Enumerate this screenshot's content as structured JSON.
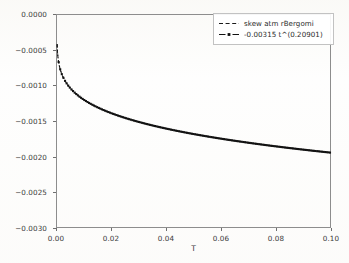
{
  "chart_data": {
    "type": "line",
    "title": "",
    "xlabel": "T",
    "ylabel": "",
    "xlim": [
      0.0,
      0.1
    ],
    "ylim": [
      -0.003,
      0.0
    ],
    "grid": false,
    "legend_position": "upper right",
    "xticks": [
      0.0,
      0.02,
      0.04,
      0.06,
      0.08,
      0.1
    ],
    "xtick_labels": [
      "0.00",
      "0.02",
      "0.04",
      "0.06",
      "0.08",
      "0.10"
    ],
    "yticks": [
      0.0,
      -0.0005,
      -0.001,
      -0.0015,
      -0.002,
      -0.0025,
      -0.003
    ],
    "ytick_labels": [
      "0.0000",
      "−0.0005",
      "−0.0010",
      "−0.0015",
      "−0.0020",
      "−0.0025",
      "−0.0030"
    ],
    "fit": {
      "coefficient": -0.00315,
      "exponent": 0.20901
    },
    "series": [
      {
        "name": "skew atm rBergomi",
        "style": "dashed",
        "marker": "none",
        "color": "#1a1a1a",
        "x": [
          0.0005,
          0.001,
          0.0015,
          0.002,
          0.0025,
          0.003,
          0.004,
          0.005,
          0.006,
          0.008,
          0.01,
          0.012,
          0.014,
          0.016,
          0.018,
          0.02,
          0.024,
          0.028,
          0.032,
          0.036,
          0.04,
          0.045,
          0.05,
          0.055,
          0.06,
          0.065,
          0.07,
          0.075,
          0.08,
          0.085,
          0.09,
          0.095,
          0.1
        ],
        "y": [
          -0.000683,
          -0.000789,
          -0.00086,
          -0.000912,
          -0.000955,
          -0.000992,
          -0.001052,
          -0.001099,
          -0.001139,
          -0.001204,
          -0.001256,
          -0.0013,
          -0.001338,
          -0.001372,
          -0.001402,
          -0.00143,
          -0.001479,
          -0.001522,
          -0.00156,
          -0.001594,
          -0.001625,
          -0.00166,
          -0.001692,
          -0.001721,
          -0.001748,
          -0.001774,
          -0.001797,
          -0.00182,
          -0.001841,
          -0.001861,
          -0.00188,
          -0.001899,
          -0.001917
        ]
      },
      {
        "name": "-0.00315 t^(0.20901)",
        "style": "dashdot",
        "marker": "square",
        "color": "#111111",
        "x": [
          0.0005,
          0.001,
          0.0015,
          0.002,
          0.0025,
          0.003,
          0.004,
          0.005,
          0.006,
          0.008,
          0.01,
          0.012,
          0.014,
          0.016,
          0.018,
          0.02,
          0.024,
          0.028,
          0.032,
          0.036,
          0.04,
          0.045,
          0.05,
          0.055,
          0.06,
          0.065,
          0.07,
          0.075,
          0.08,
          0.085,
          0.09,
          0.095,
          0.1
        ],
        "y": [
          -0.000683,
          -0.000789,
          -0.00086,
          -0.000912,
          -0.000955,
          -0.000992,
          -0.001052,
          -0.001099,
          -0.001139,
          -0.001204,
          -0.001256,
          -0.0013,
          -0.001338,
          -0.001372,
          -0.001402,
          -0.00143,
          -0.001479,
          -0.001522,
          -0.00156,
          -0.001594,
          -0.001625,
          -0.00166,
          -0.001692,
          -0.001721,
          -0.001748,
          -0.001774,
          -0.001797,
          -0.00182,
          -0.001841,
          -0.001861,
          -0.00188,
          -0.001899,
          -0.001917
        ]
      }
    ]
  },
  "legend": {
    "entries": [
      {
        "label": "skew atm rBergomi"
      },
      {
        "label": "-0.00315 t^(0.20901)"
      }
    ]
  },
  "axis": {
    "x_title": "T"
  }
}
